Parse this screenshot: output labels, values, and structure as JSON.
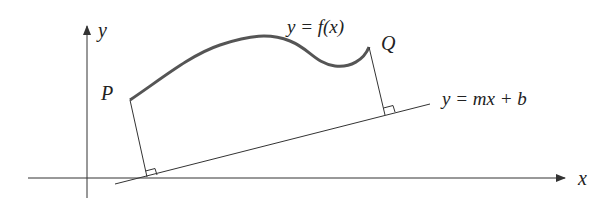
{
  "diagram": {
    "type": "geometry-figure",
    "labels": {
      "y_axis": "y",
      "x_axis": "x",
      "curve": "y = f(x)",
      "point_p": "P",
      "point_q": "Q",
      "line": "y = mx + b"
    },
    "colors": {
      "stroke": "#333333",
      "curve": "#555555",
      "background": "#ffffff"
    }
  }
}
